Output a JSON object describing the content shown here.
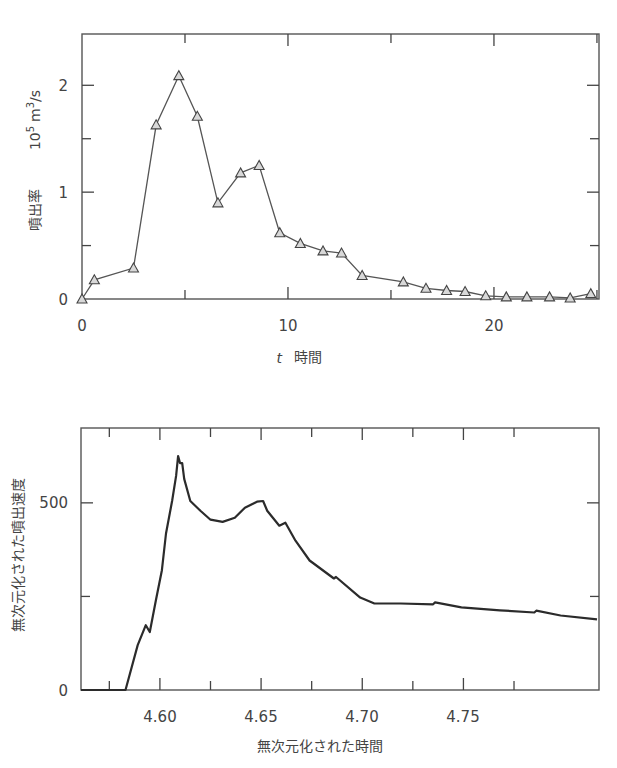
{
  "chart_data": [
    {
      "type": "line",
      "title": "",
      "xlabel": "t 時間",
      "xlabel_italic_part": "t",
      "xlabel_text_part": "時間",
      "ylabel": "噴出率",
      "yunit": "10^5 m^3/s",
      "xlim": [
        0,
        25.1
      ],
      "ylim": [
        0,
        2.48
      ],
      "xticks": [
        0,
        5,
        10,
        15,
        20,
        25
      ],
      "xtick_labels": [
        "0",
        "",
        "10",
        "",
        "20",
        ""
      ],
      "yticks": [
        0,
        0.5,
        1,
        1.5,
        2
      ],
      "ytick_labels": [
        "0",
        "",
        "1",
        "",
        "2"
      ],
      "grid": false,
      "marker": "triangle",
      "series": [
        {
          "name": "噴出率",
          "x": [
            0,
            0.6,
            2.5,
            3.6,
            4.7,
            5.6,
            6.6,
            7.7,
            8.6,
            9.6,
            10.6,
            11.7,
            12.6,
            13.6,
            15.6,
            16.7,
            17.7,
            18.6,
            19.6,
            20.6,
            21.6,
            22.7,
            23.7,
            24.7
          ],
          "values": [
            0,
            0.18,
            0.29,
            1.63,
            2.09,
            1.71,
            0.9,
            1.18,
            1.25,
            0.62,
            0.52,
            0.45,
            0.43,
            0.22,
            0.16,
            0.1,
            0.08,
            0.07,
            0.03,
            0.02,
            0.02,
            0.02,
            0.01,
            0.05
          ]
        }
      ]
    },
    {
      "type": "line",
      "title": "",
      "xlabel": "無次元化された時間",
      "ylabel": "無次元化された噴出速度",
      "xlim": [
        4.561,
        4.817
      ],
      "ylim": [
        0,
        700
      ],
      "xticks": [
        4.575,
        4.6,
        4.625,
        4.65,
        4.675,
        4.7,
        4.725,
        4.75,
        4.775
      ],
      "xtick_labels": [
        "",
        "4.60",
        "",
        "4.65",
        "",
        "4.70",
        "",
        "4.75",
        ""
      ],
      "yticks": [
        0,
        250,
        500
      ],
      "ytick_labels": [
        "0",
        "",
        "500"
      ],
      "grid": false,
      "marker": "none",
      "series": [
        {
          "name": "無次元化された噴出速度",
          "x": [
            4.561,
            4.583,
            4.589,
            4.593,
            4.595,
            4.598,
            4.601,
            4.603,
            4.606,
            4.608,
            4.609,
            4.61,
            4.611,
            4.612,
            4.615,
            4.62,
            4.625,
            4.631,
            4.637,
            4.642,
            4.648,
            4.651,
            4.653,
            4.659,
            4.662,
            4.667,
            4.674,
            4.686,
            4.687,
            4.699,
            4.706,
            4.719,
            4.735,
            4.736,
            4.749,
            4.768,
            4.785,
            4.786,
            4.798,
            4.816
          ],
          "values": [
            0,
            0,
            120,
            173,
            155,
            240,
            320,
            418,
            505,
            572,
            625,
            606,
            606,
            564,
            505,
            479,
            455,
            449,
            460,
            487,
            503,
            505,
            479,
            439,
            447,
            399,
            346,
            298,
            302,
            247,
            231,
            231,
            229,
            234,
            221,
            213,
            207,
            212,
            199,
            189
          ]
        }
      ]
    }
  ],
  "top_chart": {
    "ylabel": "噴出率",
    "yunit_base": "10",
    "yunit_exp": "5",
    "yunit_m": "m",
    "yunit_m_exp": "3",
    "yunit_rest": "/s",
    "xlabel_t": "t",
    "xlabel_text": "時間",
    "xtick_labels": [
      "0",
      "10",
      "20"
    ],
    "ytick_labels": [
      "0",
      "1",
      "2"
    ]
  },
  "bottom_chart": {
    "ylabel": "無次元化された噴出速度",
    "xlabel": "無次元化された時間",
    "xtick_labels": [
      "4.60",
      "4.65",
      "4.70",
      "4.75"
    ],
    "ytick_labels": [
      "0",
      "500"
    ]
  }
}
